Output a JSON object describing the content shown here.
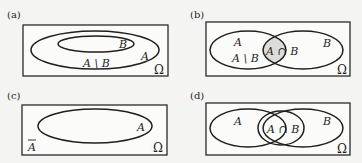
{
  "panels": [
    {
      "id": "a",
      "label": "(a)",
      "universe": "Ω",
      "sets": [
        "A",
        "B"
      ],
      "relation": "B subset of A",
      "region_labels": {
        "B": "B",
        "A": "A",
        "difference": "A \\ B"
      }
    },
    {
      "id": "b",
      "label": "(b)",
      "universe": "Ω",
      "sets": [
        "A",
        "B"
      ],
      "relation": "A and B overlap; intersection shaded",
      "region_labels": {
        "A": "A",
        "difference": "A \\ B",
        "intersection": "A ∩ B",
        "B": "B"
      },
      "shade_color": "#dcdcd8"
    },
    {
      "id": "c",
      "label": "(c)",
      "universe": "Ω",
      "sets": [
        "A"
      ],
      "relation": "complement of A",
      "region_labels": {
        "A": "A",
        "complement": "A"
      }
    },
    {
      "id": "d",
      "label": "(d)",
      "universe": "Ω",
      "sets": [
        "A",
        "B"
      ],
      "relation": "A and B overlap; intersection outlined",
      "region_labels": {
        "A": "A",
        "intersection": "A ∩ B",
        "B": "B"
      }
    }
  ],
  "colors": {
    "stroke": "#1f1f1f",
    "background": "#f4f4f2",
    "shade": "#dcdcd8"
  }
}
